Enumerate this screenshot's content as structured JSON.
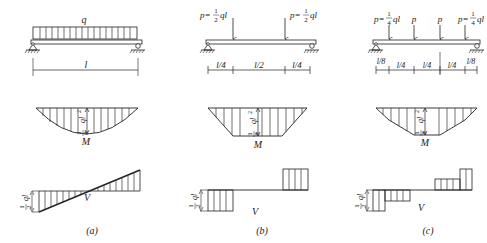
{
  "figure": {
    "panels": [
      {
        "id": "a",
        "caption": "(a)",
        "load": {
          "type": "uniform distributed load",
          "label": "q"
        },
        "dimensions": [
          "l"
        ],
        "moment_diagram": {
          "label": "M",
          "shape": "parabola",
          "max_coef": "1",
          "max_den": "8",
          "max_var": "ql",
          "max_exp": "2"
        },
        "shear_diagram": {
          "label": "V",
          "shape": "linear",
          "end_coef": "1",
          "end_den": "2",
          "end_var": "ql"
        }
      },
      {
        "id": "b",
        "caption": "(b)",
        "load": {
          "type": "two point loads",
          "label_left": "p=",
          "frac_num": "1",
          "frac_den": "2",
          "label_tail": "ql"
        },
        "dimensions": [
          "l/4",
          "l/2",
          "l/4"
        ],
        "moment_diagram": {
          "label": "M",
          "shape": "trapezoid",
          "max_coef": "1",
          "max_den": "8",
          "max_var": "ql",
          "max_exp": "2"
        },
        "shear_diagram": {
          "label": "V",
          "shape": "stepped",
          "end_coef": "1",
          "end_den": "2",
          "end_var": "ql"
        }
      },
      {
        "id": "c",
        "caption": "(c)",
        "load": {
          "type": "four point loads",
          "end_label": "p=",
          "frac_num": "1",
          "frac_den": "4",
          "label_tail": "ql",
          "mid_label": "p"
        },
        "dimensions": [
          "l/8",
          "l/4",
          "l/4",
          "l/4",
          "l/8"
        ],
        "moment_diagram": {
          "label": "M",
          "shape": "polygon",
          "max_coef": "1",
          "max_den": "8",
          "max_var": "ql",
          "max_exp": "2"
        },
        "shear_diagram": {
          "label": "V",
          "shape": "stepped",
          "end_coef": "1",
          "end_den": "2",
          "end_var": "ql"
        }
      }
    ]
  }
}
